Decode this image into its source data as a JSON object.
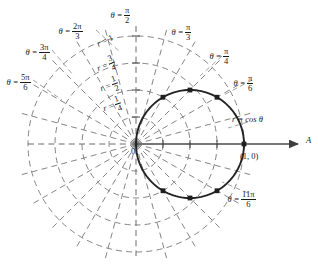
{
  "figure": {
    "type": "polar-plot",
    "curve_label": "r = cos θ",
    "axis_label": "A",
    "origin_label": "0",
    "point_label": "(1, 0)"
  },
  "radial_labels": [
    {
      "id": "r-1",
      "text_prefix": "r =",
      "num": "1",
      "den": "",
      "value": 1.0,
      "whole": true
    },
    {
      "id": "r-three-q",
      "text_prefix": "r =",
      "num": "3",
      "den": "4",
      "value": 0.75,
      "whole": false
    },
    {
      "id": "r-half",
      "text_prefix": "r =",
      "num": "1",
      "den": "2",
      "value": 0.5,
      "whole": false
    },
    {
      "id": "r-quarter",
      "text_prefix": "r =",
      "num": "1",
      "den": "4",
      "value": 0.25,
      "whole": false
    }
  ],
  "angle_labels": [
    {
      "id": "theta-pi-2",
      "theta_prefix": "θ =",
      "num": "π",
      "den": "2",
      "deg": 90
    },
    {
      "id": "theta-2pi-3",
      "theta_prefix": "θ =",
      "num": "2π",
      "den": "3",
      "deg": 120
    },
    {
      "id": "theta-3pi-4",
      "theta_prefix": "θ =",
      "num": "3π",
      "den": "4",
      "deg": 135
    },
    {
      "id": "theta-5pi-6",
      "theta_prefix": "θ =",
      "num": "5π",
      "den": "6",
      "deg": 150
    },
    {
      "id": "theta-pi-3",
      "theta_prefix": "θ =",
      "num": "π",
      "den": "3",
      "deg": 60
    },
    {
      "id": "theta-pi-4",
      "theta_prefix": "θ =",
      "num": "π",
      "den": "4",
      "deg": 45
    },
    {
      "id": "theta-pi-6",
      "theta_prefix": "θ =",
      "num": "π",
      "den": "6",
      "deg": 30
    },
    {
      "id": "theta-11pi-6",
      "theta_prefix": "θ =",
      "num": "11π",
      "den": "6",
      "deg": 330
    }
  ],
  "chart_data": {
    "type": "line",
    "title": "",
    "coordinate_system": "polar",
    "curve": {
      "name": "r = cos θ",
      "equation": "r = cos(theta)"
    },
    "grid": {
      "radial_circles": [
        0.25,
        0.5,
        0.75,
        1.0
      ],
      "angle_spokes_deg": [
        0,
        15,
        30,
        45,
        60,
        75,
        90,
        105,
        120,
        135,
        150,
        165,
        180,
        195,
        210,
        225,
        240,
        255,
        270,
        285,
        300,
        315,
        330,
        345
      ]
    },
    "marked_points": [
      {
        "theta_deg": 30,
        "theta_label": "π/6",
        "r": 0.866
      },
      {
        "theta_deg": 45,
        "theta_label": "π/4",
        "r": 0.707
      },
      {
        "theta_deg": 60,
        "theta_label": "π/3",
        "r": 0.5
      },
      {
        "theta_deg": 0,
        "theta_label": "0",
        "r": 1.0
      },
      {
        "theta_deg": 330,
        "theta_label": "11π/6",
        "r": 0.866
      },
      {
        "theta_deg": 315,
        "theta_label": "7π/4",
        "r": 0.707
      },
      {
        "theta_deg": 300,
        "theta_label": "5π/3",
        "r": 0.5
      }
    ],
    "rmax": 1.0
  },
  "colors": {
    "ink": "#1a1a1a",
    "grid": "#6b6b6b",
    "curve": "#2b2b2b",
    "axis": "#555555"
  }
}
